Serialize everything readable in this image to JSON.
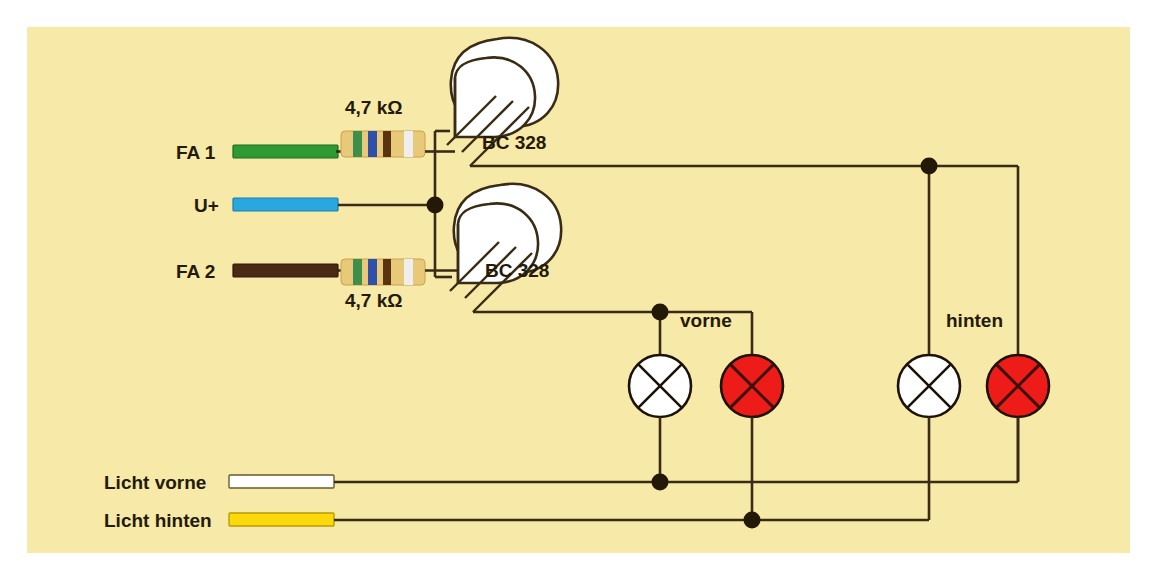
{
  "diagram": {
    "background_color": "#f7e9a8",
    "wire_color": "#3a2c14",
    "page_background": "#ffffff"
  },
  "terminals": [
    {
      "id": "fa1",
      "label": "FA 1",
      "wire_color": "#2f9a33",
      "wire_outline": "#1e6b22",
      "y": 152
    },
    {
      "id": "uplus",
      "label": "U+",
      "wire_color": "#29a8df",
      "wire_outline": "#1a7fae",
      "y": 205
    },
    {
      "id": "fa2",
      "label": "FA 2",
      "wire_color": "#4a2a12",
      "wire_outline": "#2e1a0a",
      "y": 271
    }
  ],
  "resistors": [
    {
      "id": "r1",
      "label": "4,7 kΩ",
      "label_position": "above",
      "body_color": "#e8c97a",
      "bands": [
        "#3e8f4a",
        "#2f4fa8",
        "#5a3312",
        "#e8e8e8"
      ]
    },
    {
      "id": "r2",
      "label": "4,7 kΩ",
      "label_position": "below",
      "body_color": "#e8c97a",
      "bands": [
        "#3e8f4a",
        "#2f4fa8",
        "#5a3312",
        "#e8e8e8"
      ]
    }
  ],
  "transistors": [
    {
      "id": "q1",
      "label": "BC 328",
      "body_color": "#ffffff"
    },
    {
      "id": "q2",
      "label": "BC 328",
      "body_color": "#ffffff"
    }
  ],
  "lamp_groups": [
    {
      "id": "vorne",
      "label": "vorne",
      "lamps": [
        {
          "id": "vorne-white",
          "color": "#ffffff",
          "name": "lamp-white"
        },
        {
          "id": "vorne-red",
          "color": "#ed1c18",
          "name": "lamp-red"
        }
      ]
    },
    {
      "id": "hinten",
      "label": "hinten",
      "lamps": [
        {
          "id": "hinten-white",
          "color": "#ffffff",
          "name": "lamp-white"
        },
        {
          "id": "hinten-red",
          "color": "#ed1c18",
          "name": "lamp-red"
        }
      ]
    }
  ],
  "supply_lines": [
    {
      "id": "licht-vorne",
      "label": "Licht vorne",
      "wire_color": "#ffffff",
      "wire_outline": "#6b5a2a",
      "y": 482
    },
    {
      "id": "licht-hinten",
      "label": "Licht hinten",
      "wire_color": "#fbd90a",
      "wire_outline": "#b99a08",
      "y": 520
    }
  ],
  "junction_dots": [
    {
      "id": "uplus-node",
      "x": 435,
      "y": 205
    },
    {
      "id": "q1-collector-right-node",
      "x": 929,
      "y": 154
    },
    {
      "id": "q2-collector-node",
      "x": 660,
      "y": 288
    },
    {
      "id": "vorne-white-bottom-node",
      "x": 660,
      "y": 482
    },
    {
      "id": "vorne-red-bottom-node",
      "x": 752,
      "y": 520
    }
  ]
}
